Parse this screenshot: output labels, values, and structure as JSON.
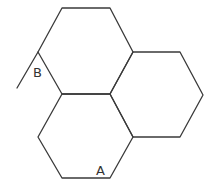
{
  "diagram": {
    "type": "fused-hexagons",
    "stroke_color": "#3a3a3a",
    "labels": [
      {
        "id": "B",
        "text": "B",
        "x": 33,
        "y": 77
      },
      {
        "id": "A",
        "text": "A",
        "x": 96,
        "y": 175
      }
    ],
    "rings": [
      {
        "name": "top",
        "points": "62,8 110,8 133,52 110,94 62,94 38,52"
      },
      {
        "name": "right",
        "points": "133,52 180,52 203,95 180,137 133,137 110,94"
      },
      {
        "name": "bottom",
        "points": "62,94 110,94 133,137 110,178 62,178 38,137"
      }
    ],
    "extra_bond": {
      "x1": 38,
      "y1": 52,
      "x2": 17,
      "y2": 88
    }
  }
}
